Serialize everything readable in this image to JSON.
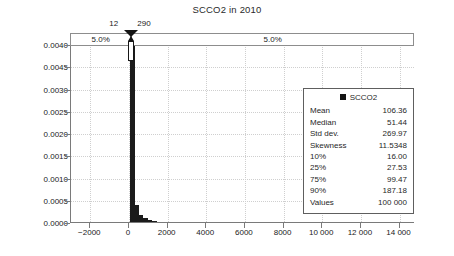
{
  "chart_data": {
    "type": "bar",
    "title": "SCCO2 in 2010",
    "xlabel": "",
    "ylabel": "",
    "grid": true,
    "xlim": [
      -3000,
      14800
    ],
    "ylim": [
      0.0,
      0.004
    ],
    "xticks": [
      "−2000",
      "0",
      "2000",
      "4000",
      "6000",
      "8000",
      "10 000",
      "12 000",
      "14 000"
    ],
    "xtick_values": [
      -2000,
      0,
      2000,
      4000,
      6000,
      8000,
      10000,
      12000,
      14000
    ],
    "yticks": [
      "0.0040",
      "0.0045",
      "0.0030",
      "0.0025",
      "0.0020",
      "0.0015",
      "0.0010",
      "0.0005",
      "0.0000"
    ],
    "ytick_values": [
      0.004,
      0.0035,
      0.003,
      0.0025,
      0.002,
      0.0015,
      0.001,
      0.0005,
      0.0
    ],
    "bars": [
      {
        "x0": 60,
        "x1": 290,
        "height": 0.00405
      },
      {
        "x0": 290,
        "x1": 520,
        "height": 0.00038
      },
      {
        "x0": 520,
        "x1": 750,
        "height": 0.00016
      },
      {
        "x0": 750,
        "x1": 980,
        "height": 9e-05
      },
      {
        "x0": 980,
        "x1": 1210,
        "height": 5e-05
      },
      {
        "x0": 1210,
        "x1": 1440,
        "height": 3e-05
      }
    ],
    "percentile_band": {
      "left_label": "5.0%",
      "right_label": "5.0%",
      "marker_low_label": "12",
      "marker_high_label": "290"
    },
    "legend": {
      "series_name": "SCCO2",
      "rows": [
        {
          "key": "Mean",
          "value": "106.36"
        },
        {
          "key": "Median",
          "value": "51.44"
        },
        {
          "key": "Std dev.",
          "value": "269.97"
        },
        {
          "key": "Skewness",
          "value": "11.5348"
        },
        {
          "key": "10%",
          "value": "16.00"
        },
        {
          "key": "25%",
          "value": "27.53"
        },
        {
          "key": "75%",
          "value": "99.47"
        },
        {
          "key": "90%",
          "value": "187.18"
        },
        {
          "key": "Values",
          "value": "100 000"
        }
      ]
    },
    "colors": {
      "bar": "#1b1b1b",
      "axis": "#7a7a7a",
      "grid": "#cfcfcf",
      "text": "#1f1f1f"
    }
  }
}
